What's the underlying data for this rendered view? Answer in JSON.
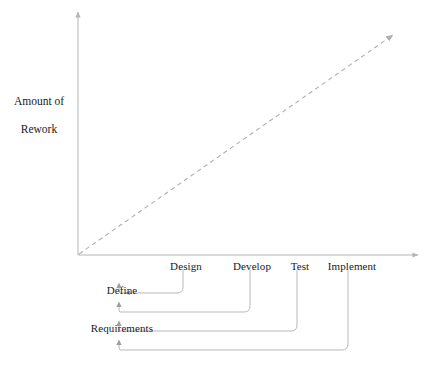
{
  "diagram": {
    "y_axis": {
      "label": "Amount of\nRework",
      "label_line1": "Amount of",
      "label_line2": "Rework"
    },
    "x_axis": {
      "label": ""
    },
    "trend": {
      "description": "dashed diagonal increasing line",
      "style": "dashed",
      "arrow": "up-right"
    },
    "stages": [
      {
        "id": "define-requirements",
        "label": "Define\nRequirements",
        "label_line1": "Define",
        "label_line2": "Requirements",
        "x": 122
      },
      {
        "id": "design",
        "label": "Design",
        "x": 186
      },
      {
        "id": "develop",
        "label": "Develop",
        "x": 252
      },
      {
        "id": "test",
        "label": "Test",
        "x": 300
      },
      {
        "id": "implement",
        "label": "Implement",
        "x": 352
      }
    ],
    "feedback_loops": [
      {
        "id": "loop-design-to-requirements",
        "from": "Design",
        "to": "Define Requirements",
        "from_x": 183,
        "y": 293
      },
      {
        "id": "loop-develop-to-requirements",
        "from": "Develop",
        "to": "Define Requirements",
        "from_x": 250,
        "y": 312
      },
      {
        "id": "loop-test-to-requirements",
        "from": "Test",
        "to": "Define Requirements",
        "from_x": 297,
        "y": 331
      },
      {
        "id": "loop-implement-to-requirements",
        "from": "Implement",
        "to": "Define Requirements",
        "from_x": 348,
        "y": 350
      }
    ],
    "colors": {
      "line": "#b9b9b9",
      "axis": "#b5b5b5",
      "text": "#1a1a1a",
      "background": "#ffffff"
    }
  }
}
